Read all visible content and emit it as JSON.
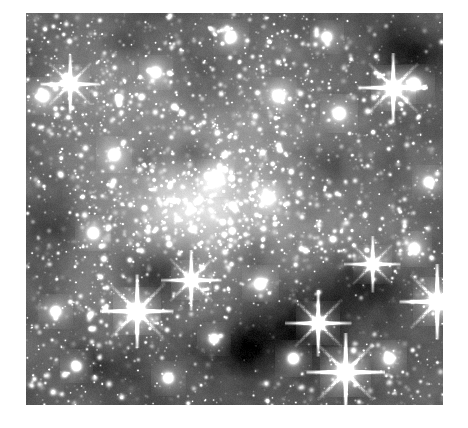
{
  "page": {
    "width": 468,
    "height": 428,
    "background_color": "#ffffff"
  },
  "figure": {
    "name": "astronomical-star-field",
    "colormap": "grayscale",
    "x": 26,
    "y": 13,
    "width": 417,
    "height": 392,
    "border": "none",
    "min_color": "#000000",
    "max_color": "#ffffff",
    "base_gray": "#4a4a4a"
  },
  "chart_data": {
    "type": "heatmap",
    "title": "",
    "xlabel": "",
    "ylabel": "",
    "colormap": "gray",
    "grid": false,
    "legend": "none",
    "xlim": [
      0,
      417
    ],
    "ylim": [
      0,
      392
    ],
    "background_luminance": 0.3,
    "noise_amplitude": 0.1,
    "star_count": 5200,
    "diffuse_glows": [
      {
        "cx": 0.47,
        "cy": 0.48,
        "rx": 0.3,
        "ry": 0.24,
        "amp": 0.3,
        "note": "central-cluster-glow"
      },
      {
        "cx": 0.4,
        "cy": 0.5,
        "rx": 0.14,
        "ry": 0.11,
        "amp": 0.26,
        "note": "core-bright-knot"
      },
      {
        "cx": 0.2,
        "cy": 0.22,
        "rx": 0.22,
        "ry": 0.2,
        "amp": 0.14,
        "note": "upper-left-glow"
      },
      {
        "cx": 0.63,
        "cy": 0.22,
        "rx": 0.2,
        "ry": 0.18,
        "amp": 0.1,
        "note": "upper-right-glow"
      },
      {
        "cx": 0.3,
        "cy": 0.72,
        "rx": 0.22,
        "ry": 0.18,
        "amp": 0.09,
        "note": "lower-left-glow"
      },
      {
        "cx": 0.78,
        "cy": 0.58,
        "rx": 0.16,
        "ry": 0.16,
        "amp": 0.08,
        "note": "right-glow"
      }
    ],
    "dark_nebulae": [
      {
        "cx": 0.33,
        "cy": 0.66,
        "rx": 0.11,
        "ry": 0.09,
        "amp": 0.26,
        "note": "center-left-dust-lane"
      },
      {
        "cx": 0.4,
        "cy": 0.36,
        "rx": 0.07,
        "ry": 0.05,
        "amp": 0.2,
        "note": "upper-center-dark-patch"
      },
      {
        "cx": 0.3,
        "cy": 0.37,
        "rx": 0.06,
        "ry": 0.05,
        "amp": 0.16,
        "note": "upper-left-dark-patch"
      },
      {
        "cx": 0.92,
        "cy": 0.1,
        "rx": 0.1,
        "ry": 0.09,
        "amp": 0.24,
        "note": "top-right-dark-cloud"
      },
      {
        "cx": 0.66,
        "cy": 0.8,
        "rx": 0.17,
        "ry": 0.13,
        "amp": 0.28,
        "note": "bottom-center-dark-cloud"
      },
      {
        "cx": 0.8,
        "cy": 0.68,
        "rx": 0.12,
        "ry": 0.1,
        "amp": 0.22,
        "note": "lower-right-dark-cloud"
      },
      {
        "cx": 0.5,
        "cy": 0.86,
        "rx": 0.13,
        "ry": 0.09,
        "amp": 0.2,
        "note": "bottom-dark-lane"
      },
      {
        "cx": 0.18,
        "cy": 0.9,
        "rx": 0.12,
        "ry": 0.08,
        "amp": 0.16,
        "note": "bottom-left-dark-patch"
      },
      {
        "cx": 0.08,
        "cy": 0.52,
        "rx": 0.07,
        "ry": 0.09,
        "amp": 0.12,
        "note": "left-edge-dark-patch"
      },
      {
        "cx": 0.55,
        "cy": 0.62,
        "rx": 0.09,
        "ry": 0.07,
        "amp": 0.14,
        "note": "mid-right-dark-patch"
      },
      {
        "cx": 0.72,
        "cy": 0.4,
        "rx": 0.08,
        "ry": 0.07,
        "amp": 0.12,
        "note": "right-dark-patch"
      },
      {
        "cx": 0.24,
        "cy": 0.08,
        "rx": 0.08,
        "ry": 0.05,
        "amp": 0.12,
        "note": "top-left-dark-patch"
      }
    ],
    "bright_stars": [
      {
        "x": 0.765,
        "y": 0.915,
        "mag": 1.0,
        "spikes": true,
        "note": "brightest-lower-right"
      },
      {
        "x": 0.985,
        "y": 0.735,
        "mag": 0.95,
        "spikes": true,
        "note": "right-edge-bright-star"
      },
      {
        "x": 0.265,
        "y": 0.76,
        "mag": 0.92,
        "spikes": true,
        "note": "left-bright-star"
      },
      {
        "x": 0.7,
        "y": 0.79,
        "mag": 0.8,
        "spikes": true,
        "note": "lower-center-star"
      },
      {
        "x": 0.88,
        "y": 0.19,
        "mag": 0.85,
        "spikes": true,
        "note": "upper-right-star"
      },
      {
        "x": 0.93,
        "y": 0.18,
        "mag": 0.7,
        "spikes": false,
        "note": "upper-right-companion"
      },
      {
        "x": 0.455,
        "y": 0.42,
        "mag": 0.62,
        "spikes": false,
        "note": "core-star"
      },
      {
        "x": 0.105,
        "y": 0.18,
        "mag": 0.68,
        "spikes": true,
        "note": "upper-left-star"
      },
      {
        "x": 0.04,
        "y": 0.21,
        "mag": 0.6,
        "spikes": false,
        "note": "left-edge-star"
      },
      {
        "x": 0.605,
        "y": 0.21,
        "mag": 0.58,
        "spikes": false,
        "note": "upper-mid-star"
      },
      {
        "x": 0.75,
        "y": 0.255,
        "mag": 0.62,
        "spikes": false,
        "note": "upper-right-mid-star"
      },
      {
        "x": 0.83,
        "y": 0.64,
        "mag": 0.64,
        "spikes": true,
        "note": "right-mid-star"
      },
      {
        "x": 0.93,
        "y": 0.6,
        "mag": 0.55,
        "spikes": false,
        "note": "right-star"
      },
      {
        "x": 0.395,
        "y": 0.68,
        "mag": 0.7,
        "spikes": true,
        "note": "center-dust-star"
      },
      {
        "x": 0.56,
        "y": 0.69,
        "mag": 0.58,
        "spikes": false,
        "note": "center-lower-star"
      },
      {
        "x": 0.16,
        "y": 0.56,
        "mag": 0.54,
        "spikes": false,
        "note": "left-mid-star"
      },
      {
        "x": 0.21,
        "y": 0.36,
        "mag": 0.56,
        "spikes": false,
        "note": "left-upper-star"
      },
      {
        "x": 0.64,
        "y": 0.88,
        "mag": 0.6,
        "spikes": false,
        "note": "bottom-star"
      },
      {
        "x": 0.87,
        "y": 0.88,
        "mag": 0.56,
        "spikes": false,
        "note": "bottom-right-star"
      },
      {
        "x": 0.34,
        "y": 0.93,
        "mag": 0.52,
        "spikes": false,
        "note": "bottom-left-star"
      },
      {
        "x": 0.49,
        "y": 0.06,
        "mag": 0.54,
        "spikes": false,
        "note": "top-center-star"
      },
      {
        "x": 0.72,
        "y": 0.06,
        "mag": 0.5,
        "spikes": false,
        "note": "top-right-star"
      },
      {
        "x": 0.07,
        "y": 0.76,
        "mag": 0.52,
        "spikes": false,
        "note": "lower-left-star"
      },
      {
        "x": 0.31,
        "y": 0.15,
        "mag": 0.5,
        "spikes": false,
        "note": "upper-field-star"
      },
      {
        "x": 0.58,
        "y": 0.47,
        "mag": 0.52,
        "spikes": false,
        "note": "center-right-star"
      },
      {
        "x": 0.965,
        "y": 0.43,
        "mag": 0.48,
        "spikes": false,
        "note": "right-edge-mid-star"
      },
      {
        "x": 0.12,
        "y": 0.9,
        "mag": 0.48,
        "spikes": false,
        "note": "bottom-left-edge-star"
      },
      {
        "x": 0.45,
        "y": 0.83,
        "mag": 0.5,
        "spikes": false,
        "note": "lower-center-star"
      }
    ]
  }
}
